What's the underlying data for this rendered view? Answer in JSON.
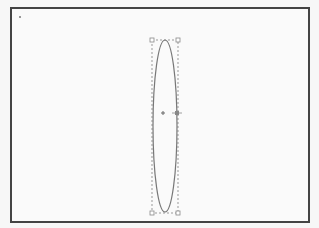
{
  "canvas": {
    "frame_color": "#444444",
    "background": "#fafafa"
  },
  "shape": {
    "type": "ellipse",
    "center": {
      "x": 165,
      "y": 126
    },
    "rx": 12,
    "ry": 87,
    "stroke": "#777777",
    "selected": true
  },
  "selection": {
    "bounding_box": {
      "x": 152,
      "y": 40,
      "width": 26,
      "height": 173
    },
    "handle_color": "#888888",
    "center_marker": {
      "x": 163,
      "y": 113
    },
    "rotation_handle": {
      "x": 177,
      "y": 113
    }
  }
}
